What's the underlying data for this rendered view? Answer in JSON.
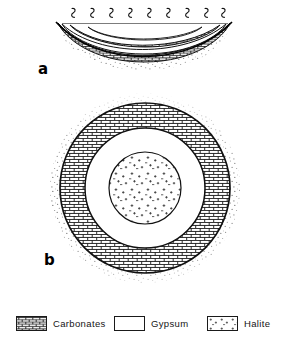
{
  "figure": {
    "background_color": "#ffffff",
    "ink_color": "#000000"
  },
  "panels": [
    {
      "id": "a",
      "label": "a",
      "view": "cross-section",
      "description": "Cross-section of a brine basin showing a water surface with evaporation squiggle symbols and concentric sediment layers thickening toward the basin centre.",
      "water_surface_symbol_count": 9,
      "water_surface_symbol_name": "evaporation-squiggle",
      "layers": [
        {
          "name": "Halite",
          "position": "basin-centre-innermost",
          "pattern": "scattered-dots"
        },
        {
          "name": "Gypsum",
          "position": "intermediate",
          "pattern": "blank"
        },
        {
          "name": "Carbonates",
          "position": "basin-margin-outermost",
          "pattern": "brick"
        },
        {
          "name": "Basement",
          "position": "beneath-basin-fill",
          "pattern": "stipple"
        }
      ]
    },
    {
      "id": "b",
      "label": "b",
      "view": "plan-view",
      "description": "Bull's-eye plan view of the same basin with concentric evaporite facies rings.",
      "rings": [
        {
          "name": "Basin surround",
          "pattern": "stipple",
          "order": 1
        },
        {
          "name": "Carbonates",
          "pattern": "brick",
          "order": 2
        },
        {
          "name": "Gypsum",
          "pattern": "blank",
          "order": 3
        },
        {
          "name": "Halite",
          "pattern": "scattered-dots",
          "order": 4
        }
      ]
    }
  ],
  "legend": {
    "items": [
      {
        "label": "Carbonates",
        "pattern": "brick",
        "swatch_name": "carbonates-swatch"
      },
      {
        "label": "Gypsum",
        "pattern": "blank",
        "swatch_name": "gypsum-swatch"
      },
      {
        "label": "Halite",
        "pattern": "scattered-dots",
        "swatch_name": "halite-swatch"
      }
    ]
  }
}
